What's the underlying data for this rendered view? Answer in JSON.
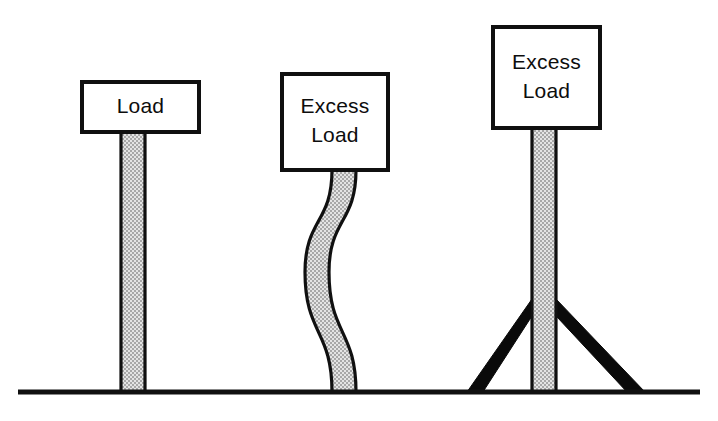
{
  "figure": {
    "background_color": "#ffffff",
    "ink_color": "#101010",
    "shaft_fill_color": "#c9c9c9",
    "brace_color": "#0a0a0a",
    "ground_line": {
      "x_start": 18,
      "x_end": 700,
      "y": 392,
      "thickness": 5
    },
    "columns": [
      {
        "id": "column-straight",
        "state": "stable",
        "label_lines": [
          "Load"
        ],
        "sign": {
          "x": 82,
          "y": 82,
          "width": 117,
          "height": 50,
          "border": 4
        },
        "shaft": {
          "x_left": 121,
          "x_right": 145,
          "y_top": 131,
          "y_bottom": 392,
          "curved": false
        },
        "braced": false
      },
      {
        "id": "column-buckled",
        "state": "buckled",
        "label_lines": [
          "Excess",
          "Load"
        ],
        "sign": {
          "x": 282,
          "y": 74,
          "width": 106,
          "height": 96,
          "border": 4
        },
        "shaft": {
          "x_left": 332,
          "x_right": 356,
          "y_top": 170,
          "y_bottom": 392,
          "curved": true
        },
        "braced": false
      },
      {
        "id": "column-braced",
        "state": "braced",
        "label_lines": [
          "Excess",
          "Load"
        ],
        "sign": {
          "x": 493,
          "y": 27,
          "width": 107,
          "height": 101,
          "border": 4
        },
        "shaft": {
          "x_left": 532,
          "x_right": 556,
          "y_top": 128,
          "y_bottom": 392,
          "curved": false
        },
        "braced": true,
        "braces": [
          {
            "id": "brace-left",
            "top_x": 532,
            "top_y": 299,
            "base_x": 467,
            "base_y": 392,
            "thickness": 13
          },
          {
            "id": "brace-right",
            "top_x": 556,
            "top_y": 299,
            "base_x": 645,
            "base_y": 392,
            "thickness": 13
          }
        ]
      }
    ]
  }
}
